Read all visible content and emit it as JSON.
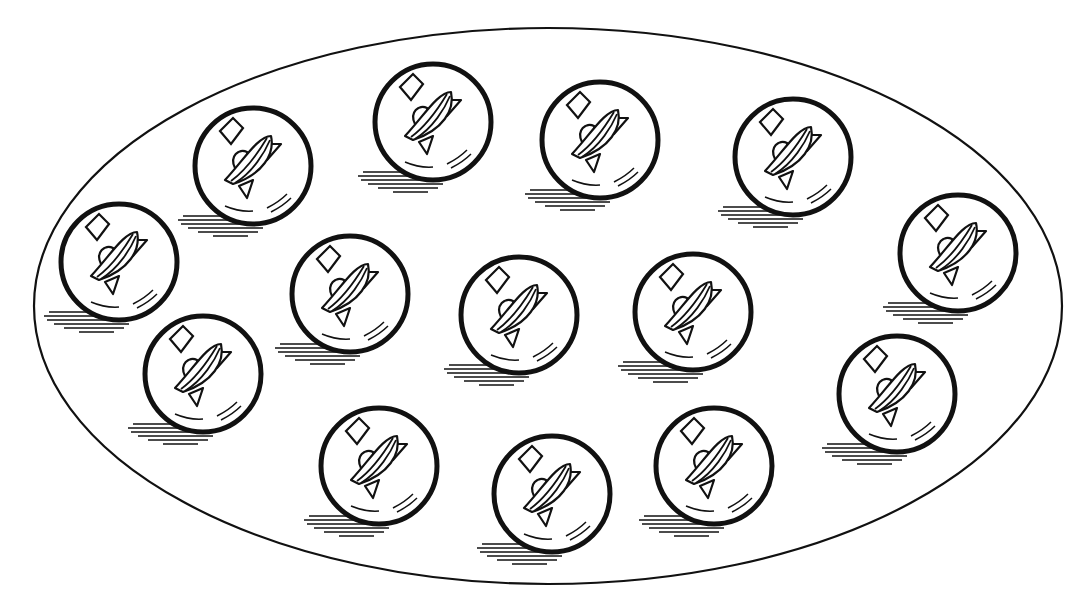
{
  "illustration": {
    "title": "Group of marbles inside an oval",
    "marble_count": 15,
    "colors": {
      "ink": "#111111",
      "background": "#ffffff"
    },
    "container": {
      "shape": "ellipse",
      "cx": 548,
      "cy": 306,
      "rx": 514,
      "ry": 278
    },
    "marble_radius": 60,
    "marbles": [
      {
        "id": 1,
        "cx": 119,
        "cy": 262
      },
      {
        "id": 2,
        "cx": 253,
        "cy": 166
      },
      {
        "id": 3,
        "cx": 433,
        "cy": 122
      },
      {
        "id": 4,
        "cx": 600,
        "cy": 140
      },
      {
        "id": 5,
        "cx": 793,
        "cy": 157
      },
      {
        "id": 6,
        "cx": 958,
        "cy": 253
      },
      {
        "id": 7,
        "cx": 203,
        "cy": 374
      },
      {
        "id": 8,
        "cx": 350,
        "cy": 294
      },
      {
        "id": 9,
        "cx": 519,
        "cy": 315
      },
      {
        "id": 10,
        "cx": 693,
        "cy": 312
      },
      {
        "id": 11,
        "cx": 897,
        "cy": 394
      },
      {
        "id": 12,
        "cx": 379,
        "cy": 466
      },
      {
        "id": 13,
        "cx": 552,
        "cy": 494
      },
      {
        "id": 14,
        "cx": 714,
        "cy": 466
      }
    ]
  }
}
